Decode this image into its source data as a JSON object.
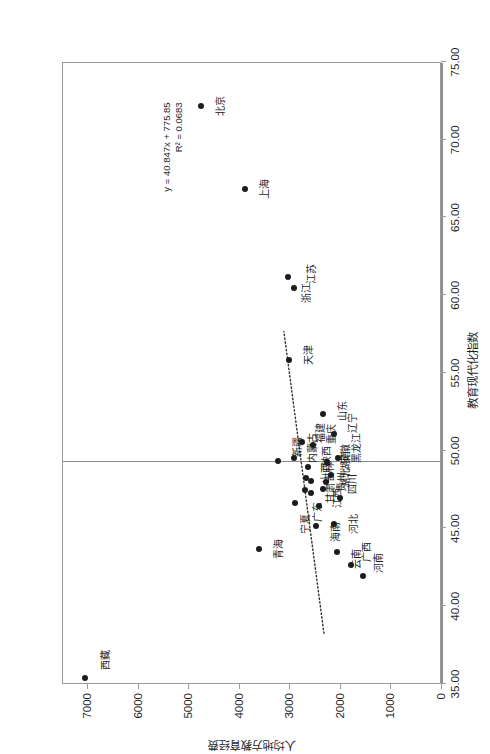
{
  "chart_data": {
    "type": "scatter",
    "title": "",
    "xlabel": "教育现代化指数",
    "ylabel": "人均地方教育经费",
    "xlim": [
      35.0,
      75.0
    ],
    "ylim": [
      0,
      7500
    ],
    "xticks": [
      "35.00",
      "40.00",
      "45.00",
      "50.00",
      "55.00",
      "60.00",
      "65.00",
      "70.00",
      "75.00"
    ],
    "xtick_values": [
      35,
      40,
      45,
      50,
      55,
      60,
      65,
      70,
      75
    ],
    "yticks": [
      "0",
      "1000",
      "2000",
      "3000",
      "4000",
      "5000",
      "6000",
      "7000"
    ],
    "ytick_values": [
      0,
      1000,
      2000,
      3000,
      4000,
      5000,
      6000,
      7000
    ],
    "grid": false,
    "legend": null,
    "trendline": {
      "equation": "y = 40.847x + 775.85",
      "r_squared": "R² = 0.0683",
      "slope": 40.847,
      "intercept": 775.85,
      "style": "dotted",
      "x_start": 38.2,
      "x_end": 57.6
    },
    "points": [
      {
        "label": "西藏",
        "x": 35.3,
        "y": 7060,
        "lx": 1.2,
        "ly": 12
      },
      {
        "label": "北京",
        "x": 72.1,
        "y": 4760,
        "lx": 0,
        "ly": 11
      },
      {
        "label": "上海",
        "x": 66.8,
        "y": 3900,
        "lx": 0,
        "ly": 11
      },
      {
        "label": "青海",
        "x": 43.6,
        "y": 3620,
        "lx": 0,
        "ly": 11
      },
      {
        "label": "新疆",
        "x": 49.3,
        "y": 3240,
        "lx": 0.9,
        "ly": 11
      },
      {
        "label": "天津",
        "x": 55.8,
        "y": 3020,
        "lx": 0.3,
        "ly": 11
      },
      {
        "label": "江苏",
        "x": 60.4,
        "y": 2930,
        "lx": 0.9,
        "ly": 9
      },
      {
        "label": "浙江",
        "x": 61.1,
        "y": 3055,
        "lx": -1.0,
        "ly": 10
      },
      {
        "label": "宁夏",
        "x": 46.6,
        "y": 2900,
        "lx": -1.4,
        "ly": 2
      },
      {
        "label": "内蒙古",
        "x": 49.5,
        "y": 2925,
        "lx": 0.6,
        "ly": 10
      },
      {
        "label": "广东",
        "x": 47.4,
        "y": 2720,
        "lx": -1.4,
        "ly": 4
      },
      {
        "label": "福建",
        "x": 50.5,
        "y": 2775,
        "lx": 0.6,
        "ly": 10
      },
      {
        "label": "陕西",
        "x": 48.9,
        "y": 2660,
        "lx": 0.7,
        "ly": 10
      },
      {
        "label": "吉林",
        "x": 48.0,
        "y": 2585,
        "lx": 0.6,
        "ly": 10
      },
      {
        "label": "甘肃",
        "x": 47.2,
        "y": 2600,
        "lx": 0.0,
        "ly": 11
      },
      {
        "label": "山西",
        "x": 48.2,
        "y": 2700,
        "lx": 0.3,
        "ly": 11
      },
      {
        "label": "重庆",
        "x": 50.3,
        "y": 2545,
        "lx": 0.7,
        "ly": 10
      },
      {
        "label": "海南",
        "x": 45.1,
        "y": 2500,
        "lx": -0.4,
        "ly": 11
      },
      {
        "label": "江西",
        "x": 46.4,
        "y": 2425,
        "lx": 0.5,
        "ly": 10
      },
      {
        "label": "贵州",
        "x": 47.5,
        "y": 2350,
        "lx": 0.4,
        "ly": 10
      },
      {
        "label": "湖北",
        "x": 47.9,
        "y": 2295,
        "lx": 0.3,
        "ly": 11
      },
      {
        "label": "安徽",
        "x": 49.2,
        "y": 2275,
        "lx": 0.5,
        "ly": 10
      },
      {
        "label": "山东",
        "x": 52.3,
        "y": 2350,
        "lx": 0.2,
        "ly": 11
      },
      {
        "label": "辽宁",
        "x": 51.0,
        "y": 2130,
        "lx": 0.7,
        "ly": 10
      },
      {
        "label": "黑龙江",
        "x": 49.5,
        "y": 2065,
        "lx": 0.6,
        "ly": 10
      },
      {
        "label": "湖南",
        "x": 48.4,
        "y": 2190,
        "lx": 0.9,
        "ly": 6
      },
      {
        "label": "四川",
        "x": 46.9,
        "y": 2010,
        "lx": 0.9,
        "ly": 4
      },
      {
        "label": "河北",
        "x": 45.2,
        "y": 2145,
        "lx": 0.0,
        "ly": 11
      },
      {
        "label": "云南",
        "x": 43.4,
        "y": 2070,
        "lx": -0.4,
        "ly": 11
      },
      {
        "label": "广西",
        "x": 42.6,
        "y": 1800,
        "lx": 0.8,
        "ly": 7
      },
      {
        "label": "河南",
        "x": 41.9,
        "y": 1560,
        "lx": 0.8,
        "ly": 7
      }
    ]
  }
}
